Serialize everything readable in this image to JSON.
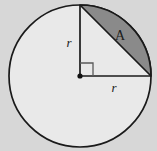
{
  "figure": {
    "type": "geometry-diagram",
    "background_color": "#d7d7d7",
    "circle": {
      "center_x": 80,
      "center_y": 76,
      "radius": 71,
      "fill_color": "#e9e9e9",
      "stroke_color": "#1a1a1a",
      "stroke_width": 1.7
    },
    "segment": {
      "fill_color": "#8a8a8a",
      "stroke_color": "#1a1a1a",
      "stroke_width": 1.7,
      "chord_start_x": 80,
      "chord_start_y": 5,
      "chord_end_x": 151,
      "chord_end_y": 76
    },
    "radii": {
      "stroke_color": "#1a1a1a",
      "stroke_width": 1.7,
      "vertical_end_x": 80,
      "vertical_end_y": 5,
      "horizontal_end_x": 151,
      "horizontal_end_y": 76
    },
    "right_angle_marker": {
      "size": 13,
      "stroke_color": "#5a5a5a",
      "stroke_width": 1.3
    },
    "center_dot": {
      "radius": 2.6,
      "fill_color": "#111111"
    },
    "labels": {
      "vertical_radius": {
        "text": "r",
        "x": 69,
        "y": 44
      },
      "horizontal_radius": {
        "text": "r",
        "x": 114,
        "y": 89
      },
      "area": {
        "text": "A",
        "x": 120,
        "y": 37
      }
    }
  }
}
